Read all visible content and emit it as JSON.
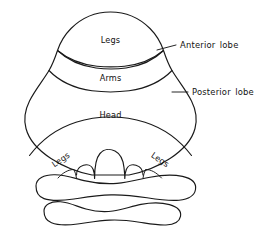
{
  "figure": {
    "background_color": "#ffffff",
    "line_color": "#1a1a1a",
    "text_color": "#111111",
    "width": 264,
    "height": 232
  },
  "region_labels": {
    "anterior_legs": "Legs",
    "anterior_arms": "Arms",
    "posterior_head": "Head",
    "posterior_legs_left": "Legs",
    "posterior_legs_right": "Legs"
  },
  "callouts": [
    {
      "id": "anterior-lobe",
      "label": "Anterior  lobe",
      "leader_start_x": 157,
      "leader_start_y": 50,
      "leader_end_x": 176,
      "leader_end_y": 45,
      "text_x": 180,
      "text_y": 45
    },
    {
      "id": "posterior-lobe",
      "label": "Posterior  lobe",
      "leader_start_x": 172,
      "leader_start_y": 92,
      "leader_end_x": 188,
      "leader_end_y": 92,
      "text_x": 192,
      "text_y": 92
    }
  ],
  "structures": [
    {
      "id": "anterior-lobe-dome",
      "name": "anterior lobe dome"
    },
    {
      "id": "legs-arms-fissure",
      "name": "fissure between legs and arms strips"
    },
    {
      "id": "primary-fissure",
      "name": "primary fissure"
    },
    {
      "id": "posterior-lobe-body",
      "name": "posterior lobe body"
    },
    {
      "id": "posterior-legs-fissure",
      "name": "posterior legs fissure"
    },
    {
      "id": "vermis-notch",
      "name": "central vermis notch"
    },
    {
      "id": "flocculus-upper",
      "name": "upper flocculonodular lobe"
    },
    {
      "id": "flocculus-lower",
      "name": "lower flocculonodular lobe"
    }
  ]
}
